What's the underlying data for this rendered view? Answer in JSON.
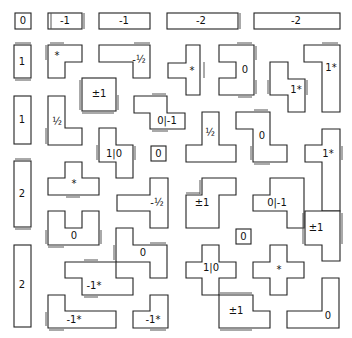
{
  "diagram": {
    "top_row": [
      {
        "id": "t0",
        "label": "0"
      },
      {
        "id": "t1",
        "label": "-1"
      },
      {
        "id": "t2",
        "label": "-1"
      },
      {
        "id": "t3",
        "label": "-2"
      },
      {
        "id": "t4",
        "label": "-2"
      }
    ],
    "left_column": [
      {
        "id": "l0",
        "label": "1"
      },
      {
        "id": "l1",
        "label": "1"
      },
      {
        "id": "l2",
        "label": "2"
      },
      {
        "id": "l3",
        "label": "2"
      }
    ],
    "pieces": [
      {
        "id": "p1",
        "label": "*"
      },
      {
        "id": "p2",
        "label": "-½"
      },
      {
        "id": "p3",
        "label": "*"
      },
      {
        "id": "p4",
        "label": "0"
      },
      {
        "id": "p5",
        "label": "1*"
      },
      {
        "id": "p6",
        "label": "1*"
      },
      {
        "id": "p7",
        "label": "±1"
      },
      {
        "id": "p8",
        "label": "½"
      },
      {
        "id": "p9",
        "label": "0|-1"
      },
      {
        "id": "p10",
        "label": "½"
      },
      {
        "id": "p11",
        "label": "0"
      },
      {
        "id": "p12",
        "label": "1|0"
      },
      {
        "id": "p13",
        "label": "0"
      },
      {
        "id": "p14",
        "label": "1*"
      },
      {
        "id": "p15",
        "label": "*"
      },
      {
        "id": "p16",
        "label": "-½"
      },
      {
        "id": "p17",
        "label": "±1"
      },
      {
        "id": "p18",
        "label": "0|-1"
      },
      {
        "id": "p19",
        "label": "±1"
      },
      {
        "id": "p20",
        "label": "0"
      },
      {
        "id": "p21",
        "label": "0"
      },
      {
        "id": "p22",
        "label": "0"
      },
      {
        "id": "p23",
        "label": "1|0"
      },
      {
        "id": "p24",
        "label": "*"
      },
      {
        "id": "p25",
        "label": "-1*"
      },
      {
        "id": "p26",
        "label": "-1*"
      },
      {
        "id": "p27",
        "label": "-1*"
      },
      {
        "id": "p28",
        "label": "±1"
      },
      {
        "id": "p29",
        "label": "0"
      }
    ]
  }
}
